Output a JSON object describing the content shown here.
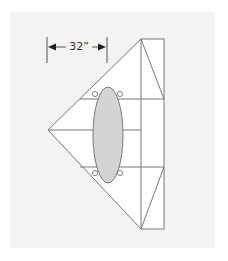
{
  "diagram": {
    "type": "floor-plan-layout",
    "dimension": {
      "label": "32”",
      "unit": "inches"
    },
    "colors": {
      "background": "#f3f3f3",
      "shape_fill": "#ffffff",
      "line": "#777777",
      "table_fill": "#d4d4d4",
      "dimension_line": "#444444"
    },
    "elements": [
      {
        "name": "triangular-platform",
        "shape": "triangle"
      },
      {
        "name": "rectangular-section",
        "shape": "rectangle"
      },
      {
        "name": "oval-table",
        "shape": "ellipse"
      },
      {
        "name": "chairs",
        "shape": "circle",
        "count": 4
      }
    ]
  }
}
